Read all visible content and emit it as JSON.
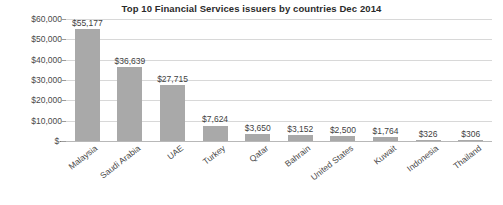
{
  "chart_data": {
    "type": "bar",
    "title": "Top 10 Financial Services issuers by countries Dec 2014",
    "xlabel": "",
    "ylabel": "",
    "ylim": [
      0,
      60000
    ],
    "grid": true,
    "legend": "none",
    "orientation": "vertical",
    "bar_color": "#a9a9a9",
    "categories": [
      "Malaysia",
      "Saudi Arabia",
      "UAE",
      "Turkey",
      "Qatar",
      "Bahrain",
      "United States",
      "Kuwait",
      "Indonesia",
      "Thailand"
    ],
    "values": [
      55177,
      36639,
      27715,
      7624,
      3650,
      3152,
      2500,
      1764,
      326,
      306
    ],
    "value_labels": [
      "$55,177",
      "$36,639",
      "$27,715",
      "$7,624",
      "$3,650",
      "$3,152",
      "$2,500",
      "$1,764",
      "$326",
      "$306"
    ],
    "ytick_values": [
      0,
      10000,
      20000,
      30000,
      40000,
      50000,
      60000
    ],
    "ytick_labels": [
      "$-",
      "$10,000",
      "$20,000",
      "$30,000",
      "$40,000",
      "$50,000",
      "$60,000"
    ]
  }
}
